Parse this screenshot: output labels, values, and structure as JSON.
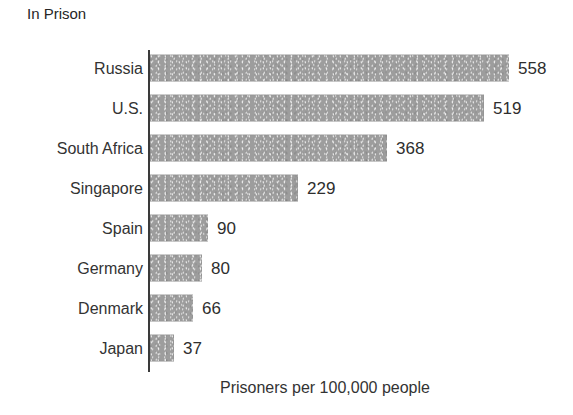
{
  "chart_data": {
    "type": "bar",
    "orientation": "horizontal",
    "title": "In Prison",
    "xlabel": "Prisoners per 100,000 people",
    "ylabel": "",
    "categories": [
      "Russia",
      "U.S.",
      "South Africa",
      "Singapore",
      "Spain",
      "Germany",
      "Denmark",
      "Japan"
    ],
    "values": [
      558,
      519,
      368,
      229,
      90,
      80,
      66,
      37
    ],
    "value_labels": [
      "558",
      "519",
      "368",
      "229",
      "90",
      "80",
      "66",
      "37"
    ],
    "xlim": [
      0,
      558
    ],
    "grid": false,
    "legend": null,
    "bar_color": "#9b9b9b",
    "axis_color": "#3a3a3a",
    "text_color": "#333333"
  },
  "chart": {
    "title": "In Prison",
    "axis_caption": "Prisoners per 100,000 people",
    "bars": [
      {
        "category": "Russia",
        "value": 558,
        "label": "558",
        "width_px": 359
      },
      {
        "category": "U.S.",
        "value": 519,
        "label": "519",
        "width_px": 334
      },
      {
        "category": "South Africa",
        "value": 368,
        "label": "368",
        "width_px": 237
      },
      {
        "category": "Singapore",
        "value": 229,
        "label": "229",
        "width_px": 148
      },
      {
        "category": "Spain",
        "value": 90,
        "label": "90",
        "width_px": 58
      },
      {
        "category": "Germany",
        "value": 80,
        "label": "80",
        "width_px": 52
      },
      {
        "category": "Denmark",
        "value": 66,
        "label": "66",
        "width_px": 43
      },
      {
        "category": "Japan",
        "value": 37,
        "label": "37",
        "width_px": 24
      }
    ]
  }
}
